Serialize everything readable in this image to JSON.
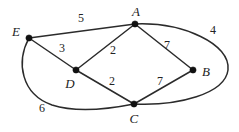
{
  "figure": {
    "type": "weighted-undirected-graph",
    "background_color": "#ffffff",
    "stroke_color": "#2b2b2b",
    "text_color": "#232323",
    "width": 239,
    "height": 132
  },
  "vertices": [
    {
      "id": "A",
      "label": "A",
      "x": 135,
      "y": 24,
      "label_x": 136,
      "label_y": 11
    },
    {
      "id": "B",
      "label": "B",
      "x": 193,
      "y": 70,
      "label_x": 206,
      "label_y": 71
    },
    {
      "id": "C",
      "label": "C",
      "x": 134,
      "y": 104,
      "label_x": 134,
      "label_y": 118
    },
    {
      "id": "D",
      "label": "D",
      "x": 76,
      "y": 70,
      "label_x": 70,
      "label_y": 83
    },
    {
      "id": "E",
      "label": "E",
      "x": 29,
      "y": 38,
      "label_x": 16,
      "label_y": 31
    }
  ],
  "edges": [
    {
      "id": "E-A",
      "from": "E",
      "to": "A",
      "weight": "5",
      "shape": "line",
      "path": "M 29 38 L 135 24",
      "label_x": 81,
      "label_y": 18
    },
    {
      "id": "E-D",
      "from": "E",
      "to": "D",
      "weight": "3",
      "shape": "line",
      "path": "M 29 38 L 76 70",
      "label_x": 62,
      "label_y": 48
    },
    {
      "id": "D-A",
      "from": "D",
      "to": "A",
      "weight": "2",
      "shape": "line",
      "path": "M 76 70 L 135 24",
      "label_x": 113,
      "label_y": 50
    },
    {
      "id": "A-B",
      "from": "A",
      "to": "B",
      "weight": "7",
      "shape": "line",
      "path": "M 135 24 L 193 70",
      "label_x": 167,
      "label_y": 45
    },
    {
      "id": "D-C",
      "from": "D",
      "to": "C",
      "weight": "2",
      "shape": "line",
      "path": "M 76 70 L 134 104",
      "label_x": 112,
      "label_y": 81
    },
    {
      "id": "C-B",
      "from": "C",
      "to": "B",
      "weight": "7",
      "shape": "line",
      "path": "M 134 104 L 193 70",
      "label_x": 160,
      "label_y": 81
    },
    {
      "id": "A-C-right",
      "from": "A",
      "to": "C",
      "weight": "4",
      "shape": "arc",
      "path": "M 135 24 C 183 22 231 44 228 70 C 225 94 178 106 134 104",
      "label_x": 213,
      "label_y": 30
    },
    {
      "id": "E-C-bottom",
      "from": "E",
      "to": "C",
      "weight": "6",
      "shape": "arc",
      "path": "M 29 38 C 16 62 21 94 52 105 C 80 114 114 108 134 104",
      "label_x": 42,
      "label_y": 108
    }
  ]
}
